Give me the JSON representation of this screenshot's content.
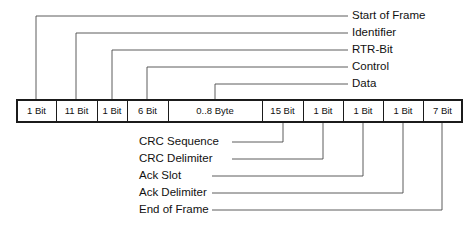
{
  "diagram": {
    "line_color": "#4a4a4a",
    "box_stroke_color": "#1b1b1b",
    "text_color": "#111111",
    "background": "#ffffff"
  },
  "frame_bar": {
    "segments": [
      {
        "id": "start-of-frame",
        "label": "1 Bit"
      },
      {
        "id": "identifier",
        "label": "11 Bit"
      },
      {
        "id": "rtr-bit",
        "label": "1 Bit"
      },
      {
        "id": "control",
        "label": "6 Bit"
      },
      {
        "id": "data",
        "label": "0..8 Byte"
      },
      {
        "id": "crc-sequence",
        "label": "15 Bit"
      },
      {
        "id": "crc-delimiter",
        "label": "1 Bit"
      },
      {
        "id": "ack-slot",
        "label": "1 Bit"
      },
      {
        "id": "ack-delimiter",
        "label": "1 Bit"
      },
      {
        "id": "end-of-frame",
        "label": "7 Bit"
      }
    ]
  },
  "callouts_top": [
    {
      "id": "start-of-frame",
      "label": "Start of Frame"
    },
    {
      "id": "identifier",
      "label": "Identifier"
    },
    {
      "id": "rtr-bit",
      "label": "RTR-Bit"
    },
    {
      "id": "control",
      "label": "Control"
    },
    {
      "id": "data",
      "label": "Data"
    }
  ],
  "callouts_bottom": [
    {
      "id": "crc-sequence",
      "label": "CRC Sequence"
    },
    {
      "id": "crc-delimiter",
      "label": "CRC Delimiter"
    },
    {
      "id": "ack-slot",
      "label": "Ack Slot"
    },
    {
      "id": "ack-delimiter",
      "label": "Ack Delimiter"
    },
    {
      "id": "end-of-frame",
      "label": "End of Frame"
    }
  ],
  "geometry": {
    "bar_x": 17,
    "bar_y": 100,
    "bar_h": 22,
    "dividers": [
      56,
      97,
      127,
      168,
      262,
      303,
      343,
      383,
      423
    ],
    "bar_x_end": 462,
    "top_label_x": 352,
    "top_tick_end": 348,
    "top_label_rows_y": [
      16,
      33,
      50,
      67,
      84
    ],
    "top_anchor_x": [
      36,
      76,
      112,
      147,
      215
    ],
    "bottom_label_x": 139,
    "bottom_label_rows_y": [
      142,
      159,
      176,
      193,
      210
    ],
    "bottom_tick_start": [
      232,
      232,
      212,
      212,
      212
    ],
    "bottom_anchor_x": [
      283,
      323,
      363,
      403,
      442
    ]
  }
}
